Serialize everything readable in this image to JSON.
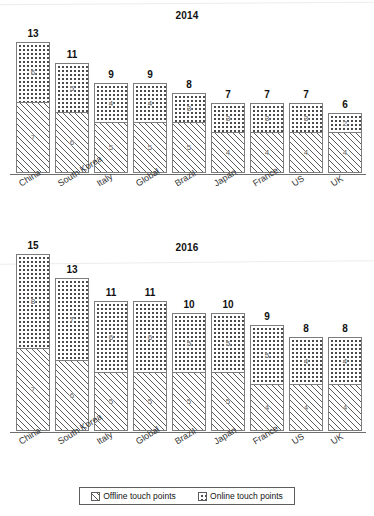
{
  "legend": {
    "offline_label": "Offline touch points",
    "online_label": "Online touch points",
    "offline_pattern": "diagonal-hatch",
    "online_pattern": "dots"
  },
  "chart_data": [
    {
      "type": "bar",
      "stacked": true,
      "title": "2014",
      "xlabel": "",
      "ylabel": "",
      "ylim": [
        0,
        15
      ],
      "grid": false,
      "legend_position": "bottom",
      "categories": [
        "China",
        "South Korea",
        "Italy",
        "Global",
        "Brazil",
        "Japan",
        "France",
        "US",
        "UK"
      ],
      "series": [
        {
          "name": "Offline touch points",
          "values": [
            7,
            6,
            5,
            5,
            5,
            4,
            4,
            4,
            4
          ]
        },
        {
          "name": "Online touch points",
          "values": [
            6,
            5,
            4,
            4,
            3,
            3,
            3,
            3,
            2
          ]
        }
      ],
      "totals": [
        13,
        11,
        9,
        9,
        8,
        7,
        7,
        7,
        6
      ]
    },
    {
      "type": "bar",
      "stacked": true,
      "title": "2016",
      "xlabel": "",
      "ylabel": "",
      "ylim": [
        0,
        15
      ],
      "grid": false,
      "legend_position": "bottom",
      "categories": [
        "China",
        "South Korea",
        "Italy",
        "Global",
        "Brazil",
        "Japan",
        "France",
        "US",
        "UK"
      ],
      "series": [
        {
          "name": "Offline touch points",
          "values": [
            7,
            6,
            5,
            5,
            5,
            5,
            4,
            4,
            4
          ]
        },
        {
          "name": "Online touch points",
          "values": [
            8,
            7,
            6,
            6,
            5,
            5,
            5,
            4,
            4
          ]
        }
      ],
      "totals": [
        15,
        13,
        11,
        11,
        10,
        10,
        9,
        8,
        8
      ]
    }
  ]
}
